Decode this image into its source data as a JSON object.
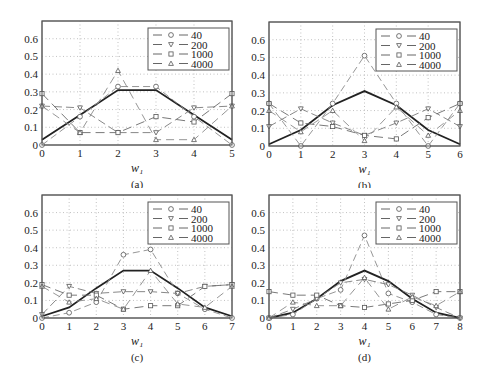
{
  "figure": {
    "legend_labels": [
      "40",
      "200",
      "1000",
      "4000"
    ],
    "xlabel": "w₁",
    "yticks": [
      "0",
      "0.1",
      "0.2",
      "0.3",
      "0.4",
      "0.5",
      "0.6"
    ]
  },
  "chart_data": [
    {
      "type": "line",
      "panel_label": "(a)",
      "xlabel": "w_1",
      "ylabel": "",
      "x": [
        0,
        1,
        2,
        3,
        4,
        5
      ],
      "xlim": [
        0,
        5
      ],
      "ylim": [
        0,
        0.7
      ],
      "grid": true,
      "legend_position": "upper right",
      "series": [
        {
          "name": "reference",
          "style": "solid-thick",
          "marker": "none",
          "values": [
            0.03,
            0.17,
            0.31,
            0.31,
            0.17,
            0.03
          ]
        },
        {
          "name": "40",
          "style": "dashed",
          "marker": "circle",
          "values": [
            0.0,
            0.16,
            0.33,
            0.33,
            0.16,
            0.0
          ]
        },
        {
          "name": "200",
          "style": "dashed",
          "marker": "triangle-down",
          "values": [
            0.22,
            0.21,
            0.07,
            0.07,
            0.21,
            0.22
          ]
        },
        {
          "name": "1000",
          "style": "dashed",
          "marker": "square",
          "values": [
            0.29,
            0.07,
            0.07,
            0.16,
            0.13,
            0.29
          ]
        },
        {
          "name": "4000",
          "style": "dashed",
          "marker": "triangle-up",
          "values": [
            0.22,
            0.07,
            0.42,
            0.03,
            0.03,
            0.22
          ]
        }
      ]
    },
    {
      "type": "line",
      "panel_label": "(b)",
      "xlabel": "w_1",
      "ylabel": "",
      "x": [
        0,
        1,
        2,
        3,
        4,
        5,
        6
      ],
      "xlim": [
        0,
        6
      ],
      "ylim": [
        0,
        0.7
      ],
      "grid": true,
      "legend_position": "upper right",
      "series": [
        {
          "name": "reference",
          "style": "solid-thick",
          "marker": "none",
          "values": [
            0.01,
            0.09,
            0.23,
            0.31,
            0.23,
            0.09,
            0.01
          ]
        },
        {
          "name": "40",
          "style": "dashed",
          "marker": "circle",
          "values": [
            0.24,
            0.0,
            0.24,
            0.51,
            0.24,
            0.0,
            0.24
          ]
        },
        {
          "name": "200",
          "style": "dashed",
          "marker": "triangle-down",
          "values": [
            0.11,
            0.21,
            0.13,
            0.06,
            0.13,
            0.21,
            0.11
          ]
        },
        {
          "name": "1000",
          "style": "dashed",
          "marker": "square",
          "values": [
            0.24,
            0.13,
            0.11,
            0.06,
            0.04,
            0.16,
            0.24
          ]
        },
        {
          "name": "4000",
          "style": "dashed",
          "marker": "triangle-up",
          "values": [
            0.2,
            0.08,
            0.2,
            0.03,
            0.22,
            0.06,
            0.2
          ]
        }
      ]
    },
    {
      "type": "line",
      "panel_label": "(c)",
      "xlabel": "w_1",
      "ylabel": "",
      "x": [
        0,
        1,
        2,
        3,
        4,
        5,
        6,
        7
      ],
      "xlim": [
        0,
        7
      ],
      "ylim": [
        0,
        0.7
      ],
      "grid": true,
      "legend_position": "upper right",
      "series": [
        {
          "name": "reference",
          "style": "solid-thick",
          "marker": "none",
          "values": [
            0.01,
            0.06,
            0.17,
            0.27,
            0.27,
            0.17,
            0.06,
            0.01
          ]
        },
        {
          "name": "40",
          "style": "dashed",
          "marker": "circle",
          "values": [
            0.0,
            0.03,
            0.09,
            0.36,
            0.39,
            0.14,
            0.05,
            0.0
          ]
        },
        {
          "name": "200",
          "style": "dashed",
          "marker": "triangle-down",
          "values": [
            0.02,
            0.18,
            0.14,
            0.15,
            0.15,
            0.14,
            0.18,
            0.19
          ]
        },
        {
          "name": "1000",
          "style": "dashed",
          "marker": "square",
          "values": [
            0.19,
            0.13,
            0.13,
            0.05,
            0.07,
            0.07,
            0.18,
            0.19
          ]
        },
        {
          "name": "4000",
          "style": "dashed",
          "marker": "triangle-up",
          "values": [
            0.18,
            0.09,
            0.11,
            0.05,
            0.27,
            0.08,
            0.06,
            0.18
          ]
        }
      ]
    },
    {
      "type": "line",
      "panel_label": "(d)",
      "xlabel": "w_1",
      "ylabel": "",
      "x": [
        0,
        1,
        2,
        3,
        4,
        5,
        6,
        7,
        8
      ],
      "xlim": [
        0,
        8
      ],
      "ylim": [
        0,
        0.7
      ],
      "grid": true,
      "legend_position": "upper right",
      "series": [
        {
          "name": "reference",
          "style": "solid-thick",
          "marker": "none",
          "values": [
            0.0,
            0.03,
            0.11,
            0.21,
            0.27,
            0.21,
            0.11,
            0.03,
            0.0
          ]
        },
        {
          "name": "40",
          "style": "dashed",
          "marker": "circle",
          "values": [
            0.0,
            0.02,
            0.11,
            0.16,
            0.47,
            0.14,
            0.09,
            0.02,
            0.0
          ]
        },
        {
          "name": "200",
          "style": "dashed",
          "marker": "triangle-down",
          "values": [
            0.0,
            0.05,
            0.11,
            0.2,
            0.22,
            0.19,
            0.13,
            0.06,
            0.0
          ]
        },
        {
          "name": "1000",
          "style": "dashed",
          "marker": "square",
          "values": [
            0.15,
            0.13,
            0.13,
            0.07,
            0.06,
            0.08,
            0.1,
            0.15,
            0.15
          ]
        },
        {
          "name": "4000",
          "style": "dashed",
          "marker": "triangle-up",
          "values": [
            0.0,
            0.09,
            0.07,
            0.07,
            0.23,
            0.05,
            0.12,
            0.07,
            0.15
          ]
        }
      ]
    }
  ]
}
